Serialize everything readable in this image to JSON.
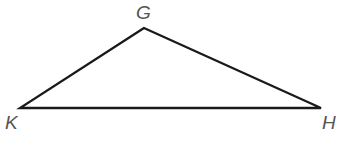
{
  "diagram": {
    "type": "triangle",
    "vertices": [
      {
        "name": "G",
        "label": "G",
        "x": 144,
        "y": 28
      },
      {
        "name": "K",
        "label": "K",
        "x": 20,
        "y": 108
      },
      {
        "name": "H",
        "label": "H",
        "x": 321,
        "y": 108
      }
    ],
    "edges": [
      [
        "G",
        "K"
      ],
      [
        "K",
        "H"
      ],
      [
        "H",
        "G"
      ]
    ],
    "stroke_color": "#1a1a1a",
    "label_color": "#555555"
  }
}
